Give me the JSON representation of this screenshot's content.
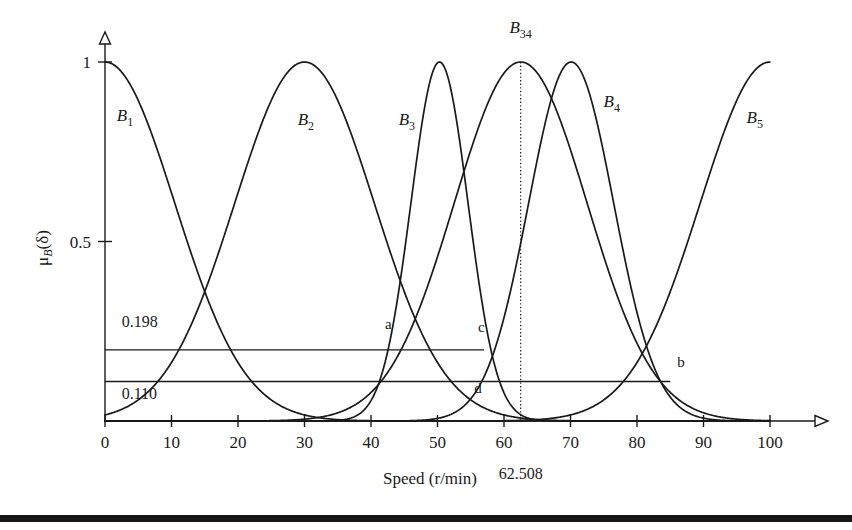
{
  "chart_data": {
    "type": "line",
    "title": "",
    "xlabel": "Speed (r/min)",
    "ylabel": "μ_B(δ)",
    "xlabel_parts": {
      "main": "Speed (r/min)"
    },
    "ylabel_parts": {
      "mu": "μ",
      "sub": "B",
      "arg": "(δ)"
    },
    "xlim": [
      0,
      100
    ],
    "ylim": [
      0,
      1
    ],
    "grid": false,
    "legend": "none",
    "xticks": [
      0,
      10,
      20,
      30,
      40,
      50,
      60,
      70,
      80,
      90,
      100
    ],
    "xtick_labels": [
      "0",
      "10",
      "20",
      "30",
      "40",
      "50",
      "60",
      "70",
      "80",
      "90",
      "100"
    ],
    "yticks": [
      0.5,
      1
    ],
    "ytick_labels": [
      "0.5",
      "1"
    ],
    "series": [
      {
        "name": "B1",
        "label": "B",
        "sub": "1",
        "type": "gaussian",
        "center": 0,
        "sigma": 10.5,
        "label_x": 3.0,
        "label_y": 0.835
      },
      {
        "name": "B2",
        "label": "B",
        "sub": "2",
        "type": "gaussian",
        "center": 30.0,
        "sigma": 10.5,
        "label_x": 30.2,
        "label_y": 0.825
      },
      {
        "name": "B3",
        "label": "B",
        "sub": "3",
        "type": "gaussian",
        "center": 50.3,
        "sigma": 4.3,
        "label_x": 45.4,
        "label_y": 0.825
      },
      {
        "name": "B34",
        "label": "B",
        "sub": "34",
        "type": "gaussian",
        "center": 62.508,
        "sigma": 10.0,
        "label_x": 62.5,
        "label_y": 1.08
      },
      {
        "name": "B4",
        "label": "B",
        "sub": "4",
        "type": "gaussian",
        "center": 70.1,
        "sigma": 6.4,
        "label_x": 76.2,
        "label_y": 0.875
      },
      {
        "name": "B5",
        "label": "B",
        "sub": "5",
        "type": "gaussian",
        "center": 100.0,
        "sigma": 10.5,
        "label_x": 97.7,
        "label_y": 0.83
      }
    ],
    "levels": [
      {
        "name": "alpha-upper",
        "value": 0.198,
        "label": "0.198",
        "x_start": 0.0,
        "x_end": 57.0,
        "label_x": 2.5,
        "label_y": 0.262
      },
      {
        "name": "alpha-lower",
        "value": 0.11,
        "label": "0.110",
        "x_start": 0.0,
        "x_end": 85.0,
        "label_x": 2.5,
        "label_y": 0.062
      }
    ],
    "markers": [
      {
        "name": "a",
        "label": "a",
        "x": 43.0,
        "label_x": 42.6,
        "label_y": 0.255
      },
      {
        "name": "c",
        "label": "c",
        "x": 56.8,
        "label_x": 56.6,
        "label_y": 0.248
      },
      {
        "name": "d",
        "label": "d",
        "x": 56.2,
        "label_x": 56.1,
        "label_y": 0.078
      },
      {
        "name": "b",
        "label": "b",
        "x": 86.0,
        "label_x": 86.6,
        "label_y": 0.15
      }
    ],
    "guides": [
      {
        "name": "b34-centroid",
        "x": 62.508,
        "label": "62.508",
        "style": "dotted",
        "y_top": 1.0,
        "y_bottom": 0.0,
        "label_y_offset": 37
      }
    ]
  }
}
